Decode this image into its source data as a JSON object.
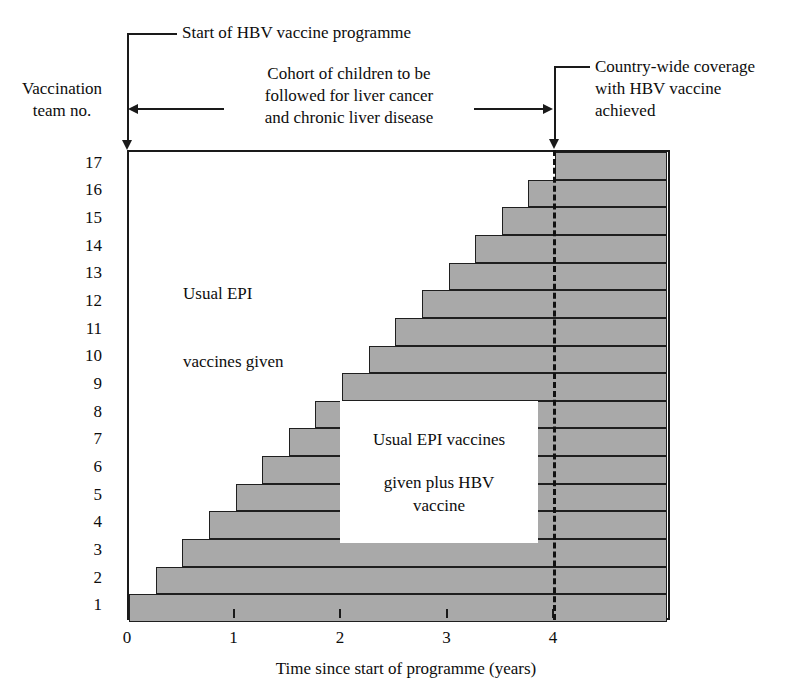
{
  "figure": {
    "y_axis_title": "Vaccination\nteam no.",
    "x_axis_title": "Time since start of programme (years)",
    "annotations": {
      "start": "Start of HBV vaccine programme",
      "cohort": "Cohort of children to be\nfollowed for liver cancer\nand chronic liver disease",
      "coverage": "Country-wide coverage\nwith HBV vaccine\nachieved"
    },
    "region_labels": {
      "epi_only": "Usual EPI\n\nvaccines given",
      "epi_plus_hbv_line1": "Usual EPI vaccines",
      "epi_plus_hbv_line2": "given plus HBV",
      "epi_plus_hbv_line3": "vaccine"
    },
    "colors": {
      "bar_fill": "#a9a9a9",
      "line": "#1a1a1a",
      "background": "#ffffff"
    }
  },
  "chart_data": {
    "type": "bar",
    "orientation": "horizontal",
    "title": "",
    "subtitle": "",
    "xlabel": "Time since start of programme (years)",
    "ylabel": "Vaccination team no.",
    "xlim": [
      0,
      5.05
    ],
    "ylim": [
      1,
      17
    ],
    "grid": false,
    "legend": null,
    "x_ticks": [
      0,
      1,
      2,
      3,
      4
    ],
    "x_tick_labels": [
      "0",
      "1",
      "2",
      "3",
      "4"
    ],
    "y_ticks": [
      1,
      2,
      3,
      4,
      5,
      6,
      7,
      8,
      9,
      10,
      11,
      12,
      13,
      14,
      15,
      16,
      17
    ],
    "y_tick_labels": [
      "1",
      "2",
      "3",
      "4",
      "5",
      "6",
      "7",
      "8",
      "9",
      "10",
      "11",
      "12",
      "13",
      "14",
      "15",
      "16",
      "17"
    ],
    "bar_unit": "years since start of programme",
    "bars": [
      {
        "team": 1,
        "start": 0.0,
        "end": 5.05
      },
      {
        "team": 2,
        "start": 0.25,
        "end": 5.05
      },
      {
        "team": 3,
        "start": 0.5,
        "end": 5.05
      },
      {
        "team": 4,
        "start": 0.75,
        "end": 5.05
      },
      {
        "team": 5,
        "start": 1.0,
        "end": 5.05
      },
      {
        "team": 6,
        "start": 1.25,
        "end": 5.05
      },
      {
        "team": 7,
        "start": 1.5,
        "end": 5.05
      },
      {
        "team": 8,
        "start": 1.75,
        "end": 5.05
      },
      {
        "team": 9,
        "start": 2.0,
        "end": 5.05
      },
      {
        "team": 10,
        "start": 2.25,
        "end": 5.05
      },
      {
        "team": 11,
        "start": 2.5,
        "end": 5.05
      },
      {
        "team": 12,
        "start": 2.75,
        "end": 5.05
      },
      {
        "team": 13,
        "start": 3.0,
        "end": 5.05
      },
      {
        "team": 14,
        "start": 3.25,
        "end": 5.05
      },
      {
        "team": 15,
        "start": 3.5,
        "end": 5.05
      },
      {
        "team": 16,
        "start": 3.75,
        "end": 5.05
      },
      {
        "team": 17,
        "start": 4.0,
        "end": 5.05
      }
    ],
    "annotations": [
      {
        "name": "start-of-programme",
        "text": "Start of HBV vaccine programme",
        "x": 0.0,
        "type": "vertical-leader-arrow"
      },
      {
        "name": "cohort-span",
        "text": "Cohort of children to be followed for liver cancer and chronic liver disease",
        "x_from": 0.0,
        "x_to": 4.0,
        "type": "double-arrow"
      },
      {
        "name": "country-wide-coverage",
        "text": "Country-wide coverage with HBV vaccine achieved",
        "x": 4.0,
        "type": "vertical-leader-arrow"
      },
      {
        "name": "coverage-dashed-line",
        "x": 4.0,
        "type": "dashed-vertical-line"
      }
    ]
  }
}
